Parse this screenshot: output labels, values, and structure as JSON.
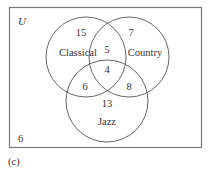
{
  "diagram": {
    "type": "venn-3",
    "universe_label": "U",
    "outside_count": "6",
    "caption": "(c)",
    "sets": [
      {
        "name": "Classical",
        "cx": 86,
        "cy": 57,
        "r": 40
      },
      {
        "name": "Country",
        "cx": 129,
        "cy": 57,
        "r": 40
      },
      {
        "name": "Jazz",
        "cx": 107,
        "cy": 101,
        "r": 41
      }
    ],
    "regions": {
      "classical_only": "15",
      "country_only": "7",
      "jazz_only": "13",
      "classical_country": "5",
      "classical_jazz": "6",
      "country_jazz": "8",
      "all_three": "4"
    },
    "colors": {
      "stroke": "#555555",
      "box_stroke": "#666666",
      "text": "#333333"
    }
  }
}
